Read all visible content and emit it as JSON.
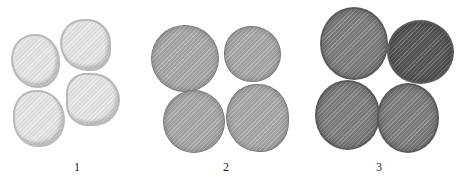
{
  "figure": {
    "groups": [
      {
        "label": "1",
        "tone": "light"
      },
      {
        "label": "2",
        "tone": "medium"
      },
      {
        "label": "3",
        "tone": "dark"
      }
    ]
  }
}
